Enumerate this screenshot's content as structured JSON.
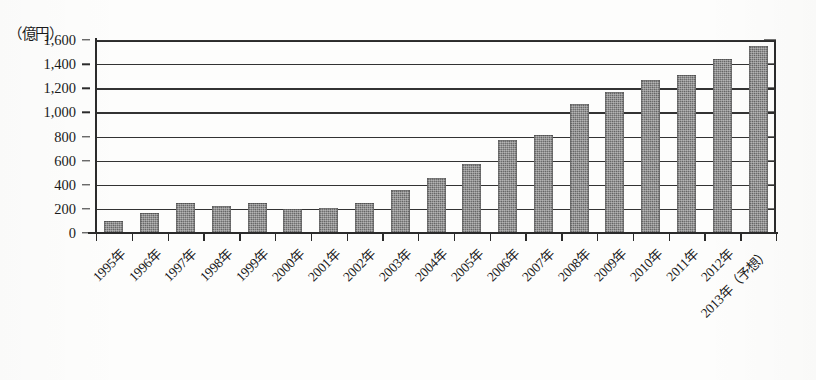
{
  "figure": {
    "unit_label": "（億円）",
    "bar_color": "#6f6f6f",
    "axis_color": "#2b2b2b"
  },
  "chart_data": {
    "type": "bar",
    "title": "",
    "subtitle": "",
    "xlabel": "",
    "ylabel": "（億円）",
    "ylim": [
      0,
      1600
    ],
    "ytick_step": 200,
    "grid": true,
    "legend": false,
    "categories": [
      "1995年",
      "1996年",
      "1997年",
      "1998年",
      "1999年",
      "2000年",
      "2001年",
      "2002年",
      "2003年",
      "2004年",
      "2005年",
      "2006年",
      "2007年",
      "2008年",
      "2009年",
      "2010年",
      "2011年",
      "2012年",
      "2013年（予想）"
    ],
    "values": [
      100,
      170,
      250,
      225,
      250,
      195,
      210,
      245,
      360,
      455,
      570,
      775,
      815,
      1070,
      1170,
      1270,
      1310,
      1440,
      1550
    ],
    "ytick_labels": [
      "0",
      "200",
      "400",
      "600",
      "800",
      "1,000",
      "1,200",
      "1,400",
      "1,600"
    ],
    "ytick_values": [
      0,
      200,
      400,
      600,
      800,
      1000,
      1200,
      1400,
      1600
    ]
  }
}
